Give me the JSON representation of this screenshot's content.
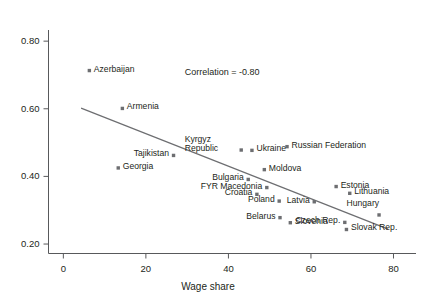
{
  "chart_data": {
    "type": "scatter",
    "title": "",
    "xlabel": "Wage share",
    "ylabel": "",
    "xlim": [
      -3.6,
      84.0
    ],
    "ylim": [
      0.172,
      0.83
    ],
    "xticks": [
      "0",
      "20",
      "40",
      "60",
      "80"
    ],
    "xtickvals": [
      0,
      20,
      40,
      60,
      80
    ],
    "yticks": [
      "0.20",
      "0.40",
      "0.60",
      "0.80"
    ],
    "ytickvals": [
      0.2,
      0.4,
      0.6,
      0.8
    ],
    "grid": false,
    "legend": "none",
    "marker_color": "#6d6e71",
    "line_color": "#6d6e71",
    "axis_color": "#58595b",
    "annotations": [
      {
        "text": "Correlation = -0.80",
        "x": 38.5,
        "y": 0.706
      }
    ],
    "trendline": {
      "type": "linear",
      "x_start": 4.3,
      "y_start": 0.602,
      "x_end": 78.7,
      "y_end": 0.244
    },
    "points": [
      {
        "name": "Azerbaijan",
        "x": 6.3,
        "y": 0.713,
        "label_side": "right"
      },
      {
        "name": "Armenia",
        "x": 14.3,
        "y": 0.601,
        "label_side": "right"
      },
      {
        "name": "Tajikistan",
        "x": 26.7,
        "y": 0.462,
        "label_side": "left"
      },
      {
        "name": "Georgia",
        "x": 13.3,
        "y": 0.425,
        "label_side": "right"
      },
      {
        "name": "Kyrgyz Republic",
        "x": 43.1,
        "y": 0.478,
        "label_side": "left"
      },
      {
        "name": "Ukraine",
        "x": 45.7,
        "y": 0.477,
        "label_side": "right"
      },
      {
        "name": "Russian Federation",
        "x": 54.2,
        "y": 0.488,
        "label_side": "right"
      },
      {
        "name": "Moldova",
        "x": 48.7,
        "y": 0.42,
        "label_side": "right"
      },
      {
        "name": "Bulgaria",
        "x": 44.8,
        "y": 0.391,
        "label_side": "left"
      },
      {
        "name": "FYR Macedonia",
        "x": 49.3,
        "y": 0.367,
        "label_side": "left"
      },
      {
        "name": "Croatia",
        "x": 46.9,
        "y": 0.347,
        "label_side": "left"
      },
      {
        "name": "Poland",
        "x": 52.3,
        "y": 0.327,
        "label_side": "left"
      },
      {
        "name": "Latvia",
        "x": 60.8,
        "y": 0.325,
        "label_side": "left"
      },
      {
        "name": "Estonia",
        "x": 66.1,
        "y": 0.37,
        "label_side": "right"
      },
      {
        "name": "Lithuania",
        "x": 69.4,
        "y": 0.35,
        "label_side": "right"
      },
      {
        "name": "Hungary",
        "x": 76.5,
        "y": 0.286,
        "label_side": "top"
      },
      {
        "name": "Belarus",
        "x": 52.5,
        "y": 0.278,
        "label_side": "left"
      },
      {
        "name": "Slovenia",
        "x": 55.0,
        "y": 0.263,
        "label_side": "right"
      },
      {
        "name": "Czech Rep.",
        "x": 68.2,
        "y": 0.264,
        "label_side": "left"
      },
      {
        "name": "Slovak Rep.",
        "x": 68.6,
        "y": 0.243,
        "label_side": "right"
      }
    ]
  }
}
